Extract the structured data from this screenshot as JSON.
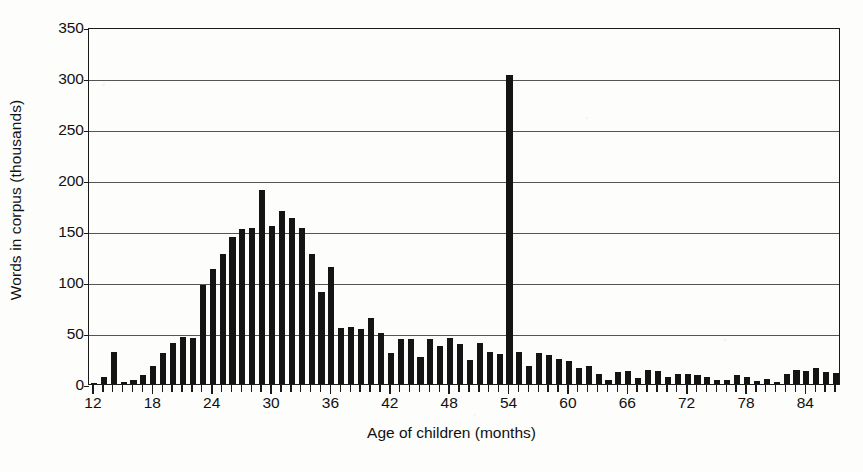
{
  "chart_data": {
    "type": "bar",
    "title": "",
    "xlabel": "Age of children (months)",
    "ylabel": "Words in corpus (thousands)",
    "xlim": [
      11.5,
      87.5
    ],
    "ylim": [
      0,
      350
    ],
    "ytick_labels": [
      "0",
      "50",
      "100",
      "150",
      "200",
      "250",
      "300",
      "350"
    ],
    "ytick_values": [
      0,
      50,
      100,
      150,
      200,
      250,
      300,
      350
    ],
    "xtick_labels": [
      "12",
      "18",
      "24",
      "30",
      "36",
      "42",
      "48",
      "54",
      "60",
      "66",
      "72",
      "78",
      "84"
    ],
    "xtick_values": [
      12,
      18,
      24,
      30,
      36,
      42,
      48,
      54,
      60,
      66,
      72,
      78,
      84
    ],
    "grid": "horizontal",
    "legend": "none",
    "bar_color": "#141414",
    "categories": [
      12,
      13,
      14,
      15,
      16,
      17,
      18,
      19,
      20,
      21,
      22,
      23,
      24,
      25,
      26,
      27,
      28,
      29,
      30,
      31,
      32,
      33,
      34,
      35,
      36,
      37,
      38,
      39,
      40,
      41,
      42,
      43,
      44,
      45,
      46,
      47,
      48,
      49,
      50,
      51,
      52,
      53,
      54,
      55,
      56,
      57,
      58,
      59,
      60,
      61,
      62,
      63,
      64,
      65,
      66,
      67,
      68,
      69,
      70,
      71,
      72,
      73,
      74,
      75,
      76,
      77,
      78,
      79,
      80,
      81,
      82,
      83,
      84,
      85,
      86,
      87
    ],
    "values": [
      1,
      7,
      31,
      2,
      4,
      9,
      18,
      30,
      40,
      46,
      45,
      97,
      113,
      127,
      144,
      152,
      153,
      190,
      155,
      170,
      163,
      153,
      127,
      90,
      115,
      55,
      56,
      54,
      65,
      50,
      30,
      44,
      44,
      26,
      44,
      37,
      45,
      39,
      24,
      40,
      31,
      29,
      303,
      31,
      18,
      30,
      28,
      25,
      23,
      16,
      18,
      10,
      4,
      12,
      13,
      6,
      14,
      13,
      7,
      10,
      10,
      9,
      7,
      4,
      4,
      9,
      7,
      3,
      5,
      2,
      10,
      14,
      13,
      16,
      12,
      11
    ]
  },
  "axis": {
    "y_title": "Words in corpus (thousands)",
    "x_title": "Age of children (months)"
  }
}
